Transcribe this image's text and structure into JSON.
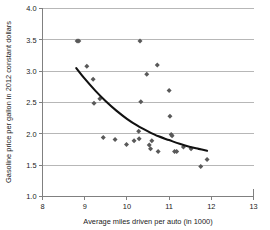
{
  "chart_data": {
    "type": "scatter",
    "title": "",
    "xlabel": "Average miles driven per auto (in 1000)",
    "ylabel": "Gasoline price per gallon in 2012 constant dollars",
    "xlim": [
      8,
      13
    ],
    "ylim": [
      1.0,
      4.0
    ],
    "xticks": [
      "8",
      "9",
      "10",
      "11",
      "12",
      "13"
    ],
    "yticks": [
      "1.0",
      "1.5",
      "2.0",
      "2.5",
      "3.0",
      "3.5",
      "4.0"
    ],
    "xtick_values": [
      8,
      9,
      10,
      11,
      12,
      13
    ],
    "ytick_values": [
      1.0,
      1.5,
      2.0,
      2.5,
      3.0,
      3.5,
      4.0
    ],
    "grid": "horizontal",
    "legend": "none",
    "marker_color": "#595959",
    "marker_shape": "diamond",
    "curve_color": "#111111",
    "points": [
      [
        8.82,
        3.48
      ],
      [
        8.86,
        3.48
      ],
      [
        9.05,
        3.08
      ],
      [
        9.2,
        2.87
      ],
      [
        9.22,
        2.49
      ],
      [
        9.36,
        2.56
      ],
      [
        9.44,
        1.94
      ],
      [
        9.72,
        1.91
      ],
      [
        9.99,
        1.83
      ],
      [
        10.17,
        1.89
      ],
      [
        10.28,
        2.04
      ],
      [
        10.29,
        1.92
      ],
      [
        10.31,
        3.48
      ],
      [
        10.33,
        2.51
      ],
      [
        10.47,
        2.95
      ],
      [
        10.53,
        1.82
      ],
      [
        10.56,
        1.76
      ],
      [
        10.59,
        1.89
      ],
      [
        10.72,
        3.1
      ],
      [
        10.74,
        1.72
      ],
      [
        11.0,
        2.69
      ],
      [
        11.02,
        2.28
      ],
      [
        11.05,
        1.99
      ],
      [
        11.07,
        1.97
      ],
      [
        11.13,
        1.72
      ],
      [
        11.18,
        1.72
      ],
      [
        11.34,
        1.79
      ],
      [
        11.52,
        1.76
      ],
      [
        11.75,
        1.48
      ],
      [
        11.9,
        1.59
      ]
    ],
    "trend_curve": [
      [
        8.8,
        3.05
      ],
      [
        9.0,
        2.88
      ],
      [
        9.25,
        2.69
      ],
      [
        9.5,
        2.52
      ],
      [
        9.75,
        2.37
      ],
      [
        10.0,
        2.24
      ],
      [
        10.25,
        2.13
      ],
      [
        10.5,
        2.04
      ],
      [
        10.75,
        1.96
      ],
      [
        11.0,
        1.9
      ],
      [
        11.25,
        1.84
      ],
      [
        11.5,
        1.79
      ],
      [
        11.7,
        1.76
      ],
      [
        11.9,
        1.73
      ]
    ]
  }
}
